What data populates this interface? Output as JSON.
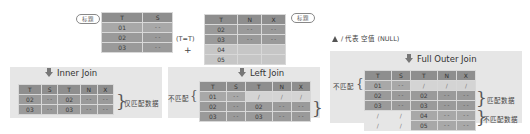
{
  "legend": {
    "null_note": "/ 代表 空值 (NULL)",
    "title_tag": "标题",
    "join_condition": "(T=T)",
    "plus": "+"
  },
  "table_left": {
    "headers": [
      "T",
      "S"
    ],
    "rows": [
      [
        "01",
        "- -"
      ],
      [
        "02",
        "- -"
      ],
      [
        "03",
        "- -"
      ]
    ]
  },
  "table_right": {
    "headers": [
      "T",
      "N",
      "X"
    ],
    "rows": [
      [
        "02",
        "- -",
        "- -"
      ],
      [
        "03",
        "- -",
        "- -"
      ],
      [
        "04",
        "",
        ""
      ],
      [
        "05",
        "",
        ""
      ]
    ]
  },
  "inner_join": {
    "title": "Inner Join",
    "headers": [
      "T",
      "S",
      "T",
      "N",
      "X"
    ],
    "rows": [
      [
        "02",
        "- -",
        "02",
        "- -",
        "- -"
      ],
      [
        "03",
        "- -",
        "03",
        "- -",
        "- -"
      ]
    ],
    "annotation": "仅匹配数据"
  },
  "left_join": {
    "title": "Left Join",
    "headers": [
      "T",
      "S",
      "T",
      "N",
      "X"
    ],
    "rows": [
      [
        "01",
        "- -",
        "/",
        "/",
        "/"
      ],
      [
        "02",
        "- -",
        "02",
        "- -",
        "- -"
      ],
      [
        "03",
        "- -",
        "03",
        "- -",
        "- -"
      ]
    ],
    "annotation_unmatched": "不匹配"
  },
  "full_outer_join": {
    "title": "Full Outer Join",
    "headers": [
      "T",
      "S",
      "T",
      "N",
      "X"
    ],
    "rows": [
      [
        "01",
        "- -",
        "/",
        "/",
        "/"
      ],
      [
        "02",
        "- -",
        "02",
        "- -",
        "- -"
      ],
      [
        "03",
        "- -",
        "03",
        "- -",
        "- -"
      ],
      [
        "/",
        "/",
        "04",
        "- -",
        "- -"
      ],
      [
        "/",
        "/",
        "05",
        "- -",
        "- -"
      ]
    ],
    "annotation_unmatched": "不匹配",
    "annotation_matched": "匹配数据",
    "annotation_unmatched_data": "不匹配数据"
  },
  "colors": {
    "header": "#8e8e8e",
    "cell_dark": "#9a9a9a",
    "cell_light": "#c6c6c6",
    "panel": "#e6e6e6",
    "null_cell": "#d4d4d4"
  }
}
